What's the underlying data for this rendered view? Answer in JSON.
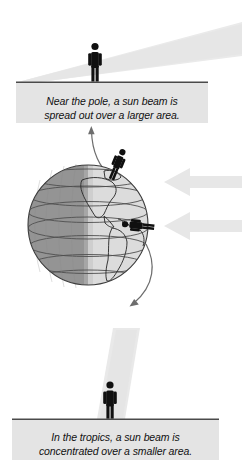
{
  "figure": {
    "title": "Sun beam angle and surface area",
    "background_color": "#ffffff"
  },
  "colors": {
    "beam": "#e9e9e9",
    "beam_edge": "#dcdcdc",
    "panel_fill": "#e4e4e4",
    "panel_rule": "#4a4a4a",
    "figure_black": "#101010",
    "globe_night": "#8f8f8f",
    "globe_day": "#d8d8d8",
    "globe_outline": "#3c3c3c",
    "grid_line": "#5a5a5a",
    "curved_arrow": "#6d6d6d",
    "ray_arrow": "#e6e6e6"
  },
  "top_panel": {
    "name": "near-the-pole-caption",
    "line1": "Near the pole, a sun beam is",
    "line2": "spread out over a larger area.",
    "full_text": "Near the pole, a sun beam is spread out over a larger area.",
    "measure_arrow": {
      "label": "wide spread width",
      "x_start": 57,
      "x_end": 136,
      "y": 91,
      "width_px": 79,
      "double_headed": true
    }
  },
  "bottom_panel": {
    "name": "in-the-tropics-caption",
    "line1": "In the tropics, a sun beam is",
    "line2": "concentrated over a smaller area.",
    "full_text": "In the tropics, a sun beam is concentrated over a smaller area.",
    "measure_arrow": {
      "label": "narrow spread width",
      "x_start": 96,
      "x_end": 124,
      "y": 428,
      "width_px": 28,
      "double_headed": true
    }
  },
  "top_scene": {
    "name": "oblique-sun-beam-scene",
    "beam": {
      "name": "oblique-sun-beam",
      "description": "wide low-angle beam entering from upper right",
      "angle_label": "oblique"
    },
    "person": {
      "name": "person-near-pole",
      "x": 95,
      "ground_y": 81
    },
    "ground_line_y": 82
  },
  "bottom_scene": {
    "name": "direct-sun-beam-scene",
    "beam": {
      "name": "direct-sun-beam",
      "description": "narrow near-vertical beam striking the ground",
      "angle_label": "direct"
    },
    "person": {
      "name": "person-in-tropics",
      "x": 110,
      "ground_y": 419
    },
    "ground_line_y": 419
  },
  "globe": {
    "name": "earth-globe",
    "center_x": 88,
    "center_y": 225,
    "radius": 60,
    "tilt_degrees": 23.5,
    "day_side": "right",
    "night_side": "left",
    "continents_shown": "Americas",
    "latitude_lines": 7,
    "people": [
      {
        "name": "person-at-pole",
        "location_label": "near the pole",
        "x": 116,
        "y": 168
      },
      {
        "name": "person-at-equator",
        "location_label": "in the tropics",
        "x": 142,
        "y": 226
      }
    ],
    "sun_rays": [
      {
        "name": "sun-ray-upper",
        "y": 182,
        "direction": "left",
        "target_label": "polar latitudes"
      },
      {
        "name": "sun-ray-lower",
        "y": 226,
        "direction": "left",
        "target_label": "tropical latitudes"
      }
    ]
  },
  "connectors": [
    {
      "name": "callout-arrow-to-top-panel",
      "description": "curved arrow from the polar figure up to the top caption",
      "direction": "up"
    },
    {
      "name": "callout-arrow-to-bottom-panel",
      "description": "curved arrow from the equatorial figure down to the bottom caption",
      "direction": "down"
    }
  ]
}
